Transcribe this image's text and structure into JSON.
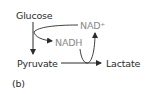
{
  "diagram": {
    "nodes": {
      "glucose": "Glucose",
      "pyruvate": "Pyruvate",
      "lactate": "Lactate",
      "nad": "NAD⁺",
      "nadh": "NADH"
    },
    "panel_label": "(b)",
    "edges": [
      {
        "from": "Glucose",
        "to": "Pyruvate"
      },
      {
        "from": "NAD⁺",
        "to": "NADH"
      },
      {
        "from": "Pyruvate",
        "to": "Lactate"
      },
      {
        "from": "NADH",
        "to": "NAD⁺"
      }
    ],
    "colors": {
      "main": "#2b2b2b",
      "cofactor": "#8a8a8a"
    }
  }
}
